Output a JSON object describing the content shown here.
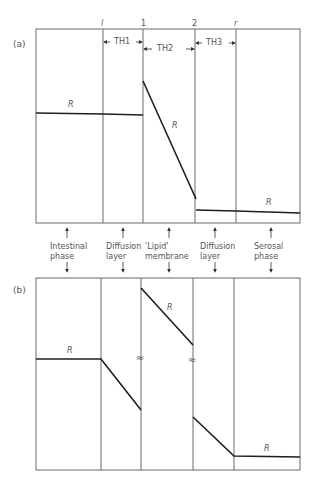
{
  "panel_a": {
    "label": "(a)",
    "boundary_labels": [
      "l",
      "1",
      "2",
      "r"
    ],
    "thickness_labels": [
      "TH1",
      "TH2",
      "TH3"
    ],
    "curve_label": "R"
  },
  "panel_b": {
    "label": "(b)",
    "curve_label": "R",
    "equilibrium_symbol": "≈"
  },
  "phases": [
    {
      "line1": "Intestinal",
      "line2": "phase"
    },
    {
      "line1": "Diffusion",
      "line2": "layer"
    },
    {
      "line1": "'Lipid'",
      "line2": "membrane"
    },
    {
      "line1": "Diffusion",
      "line2": "layer"
    },
    {
      "line1": "Serosal",
      "line2": "phase"
    }
  ]
}
